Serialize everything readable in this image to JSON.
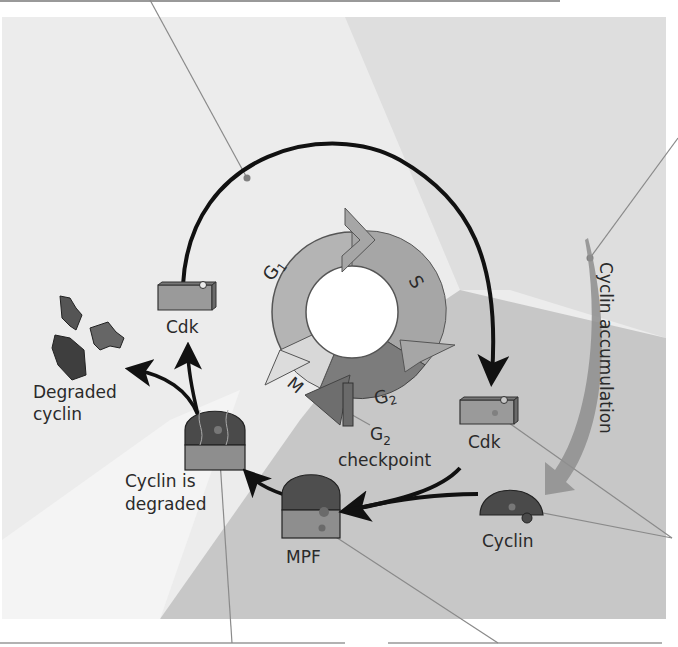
{
  "phases": {
    "g1": {
      "label": "G",
      "sub": "1"
    },
    "s": {
      "label": "S"
    },
    "g2": {
      "label": "G",
      "sub": "2"
    },
    "m": {
      "label": "M"
    }
  },
  "labels": {
    "cdk_top": "Cdk",
    "cdk_right": "Cdk",
    "cyclin": "Cyclin",
    "mpf": "MPF",
    "cyclin_degraded_line1": "Cyclin is",
    "cyclin_degraded_line2": "degraded",
    "degraded_cyclin_line1": "Degraded",
    "degraded_cyclin_line2": "cyclin",
    "checkpoint_g": "G",
    "checkpoint_sub": "2",
    "checkpoint_word": "checkpoint",
    "cyclin_accumulation": "Cyclin accumulation"
  },
  "colors": {
    "bg_light": "#ececec",
    "bg_mid": "#dcdcdc",
    "bg_dark": "#c4c4c4",
    "g1": "#b4b4b4",
    "s": "#a6a6a6",
    "g2": "#7c7c7c",
    "m": "#d8d8d8",
    "cdk": "#9a9a9a",
    "cyclin": "#555555",
    "leader": "#8a8a8a"
  }
}
